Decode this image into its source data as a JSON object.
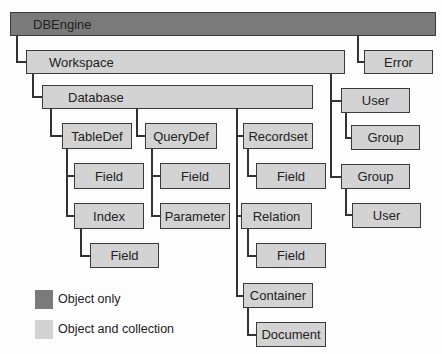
{
  "diagram": {
    "nodes": {
      "dbengine": "DBEngine",
      "workspace": "Workspace",
      "error": "Error",
      "database": "Database",
      "user": "User",
      "user_group": "Group",
      "group": "Group",
      "group_user": "User",
      "tabledef": "TableDef",
      "tabledef_field": "Field",
      "index": "Index",
      "index_field": "Field",
      "querydef": "QueryDef",
      "querydef_field": "Field",
      "parameter": "Parameter",
      "recordset": "Recordset",
      "recordset_field": "Field",
      "relation": "Relation",
      "relation_field": "Field",
      "container": "Container",
      "document": "Document"
    },
    "legend": {
      "object_only": "Object only",
      "object_and_collection": "Object and collection"
    },
    "colors": {
      "object_only": "#7a7a7a",
      "object_and_collection": "#d3d3d3",
      "line": "#333333"
    }
  }
}
